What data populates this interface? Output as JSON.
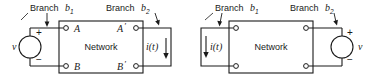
{
  "figure": {
    "type": "circuit-diagram-pair",
    "line_color": "#1a1a1a",
    "background": "#ffffff"
  },
  "left_circuit": {
    "name": "voltage-source-drives-network",
    "branch1_label": "Branch",
    "branch1_symbol": "b",
    "branch1_sub": "1",
    "branch2_label": "Branch",
    "branch2_symbol": "b",
    "branch2_sub": "2",
    "network_label": "Network",
    "source_label": "v",
    "plus_sign": "+",
    "minus_sign": "−",
    "terminal_a": "A",
    "terminal_b": "B",
    "terminal_a_prime": "A",
    "terminal_b_prime": "B",
    "prime_mark": "′",
    "current_label": "i(t)"
  },
  "right_circuit": {
    "name": "network-drives-voltage-source",
    "branch1_label": "Branch",
    "branch1_symbol": "b",
    "branch1_sub": "1",
    "branch2_label": "Branch",
    "branch2_symbol": "b",
    "branch2_sub": "2",
    "network_label": "Network",
    "source_label": "v",
    "plus_sign": "+",
    "minus_sign": "−",
    "current_label": "i(t)"
  }
}
